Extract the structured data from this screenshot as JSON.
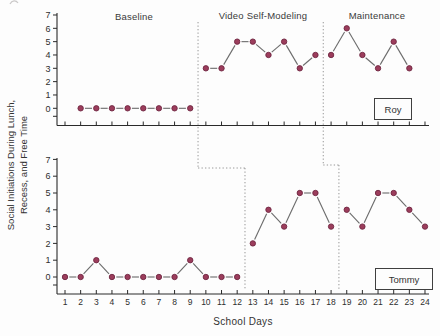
{
  "figure_labels": {
    "y_axis_line1": "Social Initiations During Lunch,",
    "y_axis_line2": "Recess, and Free Time",
    "x_axis": "School Days"
  },
  "chart_data": {
    "type": "line",
    "title": "",
    "xlabel": "School Days",
    "ylabel": "Social Initiations During Lunch, Recess, and Free Time",
    "xlim": [
      1,
      24
    ],
    "ylim": [
      0,
      7
    ],
    "x_ticks": [
      1,
      2,
      3,
      4,
      5,
      6,
      7,
      8,
      9,
      10,
      11,
      12,
      13,
      14,
      15,
      16,
      17,
      18,
      19,
      20,
      21,
      22,
      23,
      24
    ],
    "y_ticks": [
      0,
      1,
      2,
      3,
      4,
      5,
      6,
      7
    ],
    "grid": false,
    "phase_labels": [
      "Baseline",
      "Video Self-Modeling",
      "Maintenance"
    ],
    "marker_color": "#9c3d5c",
    "marker_edge_color": "#6f2742",
    "line_color": "#6b6b6b",
    "axis_color": "#2a2a2a",
    "boundary_line_color": "#8a8a8a",
    "panels": [
      {
        "participant": "Roy",
        "phases": [
          {
            "phase": "Baseline",
            "days": [
              2,
              3,
              4,
              5,
              6,
              7,
              8,
              9
            ],
            "values": [
              0,
              0,
              0,
              0,
              0,
              0,
              0,
              0
            ]
          },
          {
            "phase": "Video Self-Modeling",
            "days": [
              10,
              11,
              12,
              13,
              14,
              15,
              16,
              17
            ],
            "values": [
              3,
              3,
              5,
              5,
              4,
              5,
              3,
              4
            ]
          },
          {
            "phase": "Maintenance",
            "days": [
              18,
              19,
              20,
              21,
              22,
              23
            ],
            "values": [
              4,
              6,
              4,
              3,
              5,
              3
            ]
          }
        ]
      },
      {
        "participant": "Tommy",
        "phases": [
          {
            "phase": "Baseline",
            "days": [
              1,
              2,
              3,
              4,
              5,
              6,
              7,
              8,
              9,
              10,
              11,
              12
            ],
            "values": [
              0,
              0,
              1,
              0,
              0,
              0,
              0,
              0,
              1,
              0,
              0,
              0
            ]
          },
          {
            "phase": "Video Self-Modeling",
            "days": [
              13,
              14,
              15,
              16,
              17,
              18
            ],
            "values": [
              2,
              4,
              3,
              5,
              5,
              3
            ]
          },
          {
            "phase": "Maintenance",
            "days": [
              19,
              20,
              21,
              22,
              23,
              24
            ],
            "values": [
              4,
              3,
              5,
              5,
              4,
              3
            ]
          }
        ]
      }
    ],
    "phase_boundaries": [
      {
        "top_panel_after_day": 9,
        "bottom_panel_after_day": 12
      },
      {
        "top_panel_after_day": 17,
        "bottom_panel_after_day": 18
      }
    ]
  }
}
